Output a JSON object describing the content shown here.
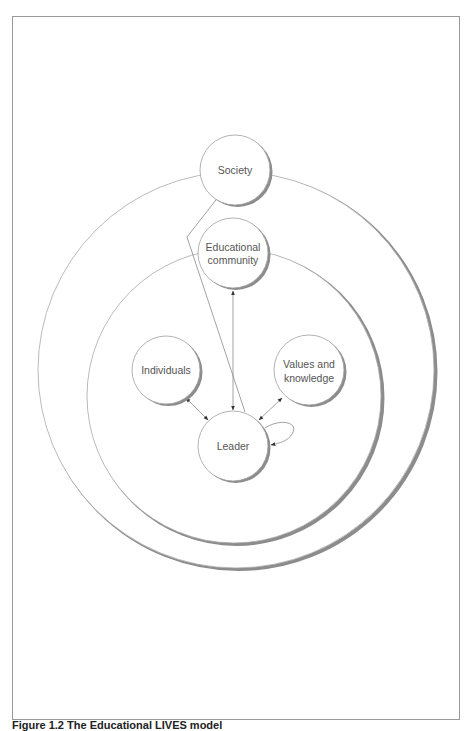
{
  "figure": {
    "caption": "Figure 1.2 The Educational LIVES model",
    "nodes": {
      "society": "Society",
      "educational_community_line1": "Educational",
      "educational_community_line2": "community",
      "individuals": "Individuals",
      "values_line1": "Values and",
      "values_line2": "knowledge",
      "leader": "Leader"
    },
    "rings": [
      "Society ring (outer)",
      "Educational community ring (inner)"
    ],
    "edges": [
      {
        "from": "Leader",
        "to": "Society",
        "type": "one-way"
      },
      {
        "from": "Leader",
        "to": "Educational community",
        "type": "two-way"
      },
      {
        "from": "Leader",
        "to": "Individuals",
        "type": "two-way"
      },
      {
        "from": "Leader",
        "to": "Values and knowledge",
        "type": "two-way"
      },
      {
        "from": "Leader",
        "to": "Leader",
        "type": "self-loop"
      }
    ],
    "colors": {
      "stroke": "#9a9a9a",
      "shadow": "#8c8c8c",
      "text": "#555555",
      "arrow": "#333333"
    }
  }
}
